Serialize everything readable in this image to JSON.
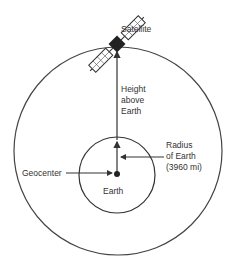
{
  "diagram": {
    "labels": {
      "satellite": "Satellite",
      "height_line1": "Height",
      "height_line2": "above",
      "height_line3": "Earth",
      "radius_line1": "Radius",
      "radius_line2": "of Earth",
      "radius_line3": "(3960 mi)",
      "geocenter": "Geocenter",
      "earth": "Earth"
    },
    "colors": {
      "stroke": "#333333",
      "satellite_body": "#222222"
    }
  }
}
